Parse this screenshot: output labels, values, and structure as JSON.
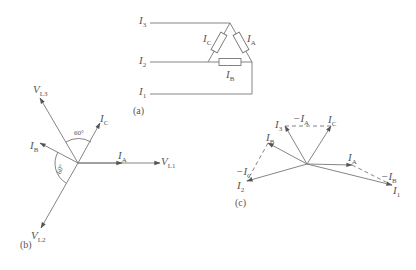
{
  "diagram_a": {
    "caption": "(a)",
    "lines": {
      "I3": {
        "main": "I",
        "sub": "3"
      },
      "I2": {
        "main": "I",
        "sub": "2"
      },
      "I1": {
        "main": "I",
        "sub": "1"
      }
    },
    "branches": {
      "IC": {
        "main": "I",
        "sub": "C"
      },
      "IA": {
        "main": "I",
        "sub": "A"
      },
      "IB": {
        "main": "I",
        "sub": "B"
      }
    }
  },
  "diagram_b": {
    "caption": "(b)",
    "angle_top": "60°",
    "angle_left": "60°",
    "labels": {
      "VL1": {
        "main": "V",
        "sub": "L1"
      },
      "VL2": {
        "main": "V",
        "sub": "L2"
      },
      "VL3": {
        "main": "V",
        "sub": "L3"
      },
      "IA": {
        "main": "I",
        "sub": "A"
      },
      "IB": {
        "main": "I",
        "sub": "B"
      },
      "IC": {
        "main": "I",
        "sub": "C"
      }
    }
  },
  "diagram_c": {
    "caption": "(c)",
    "labels": {
      "I1": {
        "main": "I",
        "sub": "1"
      },
      "I2": {
        "main": "I",
        "sub": "2"
      },
      "I3": {
        "main": "I",
        "sub": "3"
      },
      "IA": {
        "main": "I",
        "sub": "A"
      },
      "IB": {
        "main": "I",
        "sub": "B"
      },
      "IC": {
        "main": "I",
        "sub": "C"
      },
      "negIA": {
        "main": "−I",
        "sub": "A"
      },
      "negIB": {
        "main": "−I",
        "sub": "B"
      },
      "negIC": {
        "main": "−I",
        "sub": "C"
      }
    }
  },
  "colors": {
    "line": "#777777",
    "arrow": "#555555",
    "text": "#555555"
  }
}
